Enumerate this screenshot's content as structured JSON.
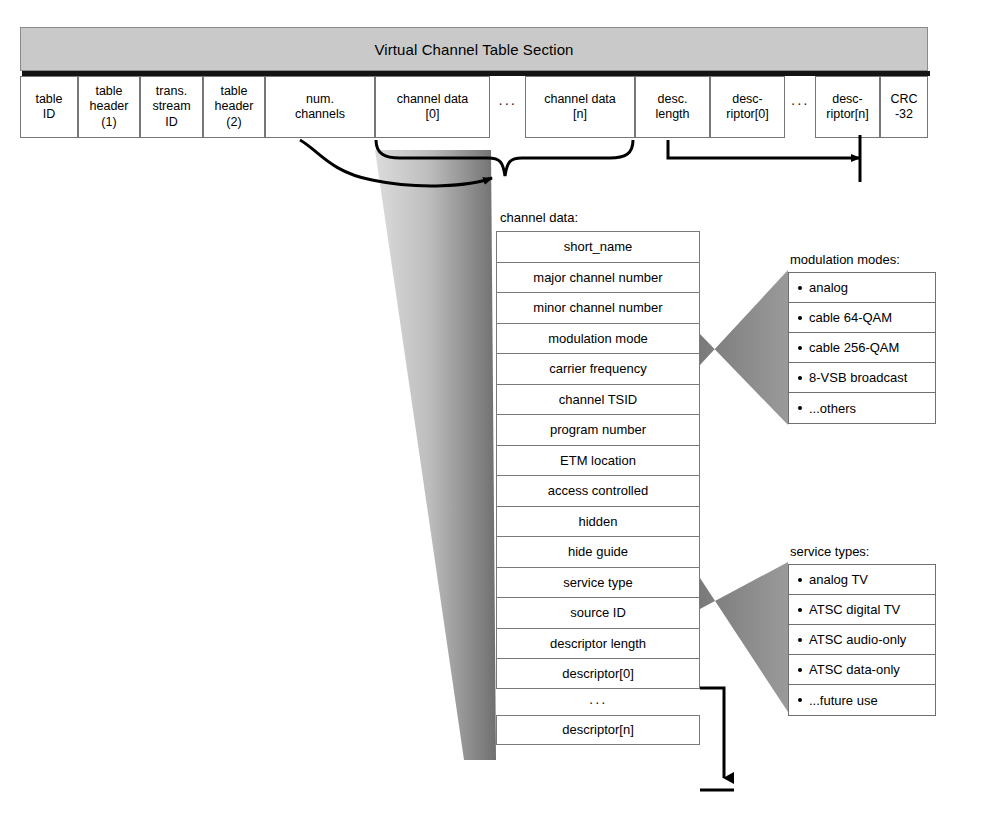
{
  "section": {
    "title": "Virtual Channel Table Section",
    "fields": [
      {
        "label": "table\nID",
        "name": "field-table-id",
        "x": 0,
        "w": 58
      },
      {
        "label": "table\nheader\n(1)",
        "name": "field-table-header-1",
        "x": 58,
        "w": 62
      },
      {
        "label": "trans.\nstream\nID",
        "name": "field-trans-stream-id",
        "x": 120,
        "w": 63
      },
      {
        "label": "table\nheader\n(2)",
        "name": "field-table-header-2",
        "x": 183,
        "w": 62
      },
      {
        "label": "num.\nchannels",
        "name": "field-num-channels",
        "x": 245,
        "w": 110
      },
      {
        "label": "channel data\n[0]",
        "name": "field-channel-data-0",
        "x": 355,
        "w": 115
      },
      {
        "label": "···",
        "name": "field-ellipsis-1",
        "x": 470,
        "w": 35,
        "ellipsis": true
      },
      {
        "label": "channel data\n[n]",
        "name": "field-channel-data-n",
        "x": 505,
        "w": 110
      },
      {
        "label": "desc.\nlength",
        "name": "field-desc-length",
        "x": 615,
        "w": 75
      },
      {
        "label": "desc-\nriptor[0]",
        "name": "field-descriptor-0",
        "x": 690,
        "w": 75
      },
      {
        "label": "···",
        "name": "field-ellipsis-2",
        "x": 765,
        "w": 30,
        "ellipsis": true
      },
      {
        "label": "desc-\nriptor[n]",
        "name": "field-descriptor-n",
        "x": 795,
        "w": 65
      },
      {
        "label": "CRC\n-32",
        "name": "field-crc-32",
        "x": 860,
        "w": 48
      }
    ]
  },
  "channel_data": {
    "caption": "channel data:",
    "rows": [
      "short_name",
      "major channel number",
      "minor channel number",
      "modulation mode",
      "carrier frequency",
      "channel TSID",
      "program number",
      "ETM location",
      "access controlled",
      "hidden",
      "hide guide",
      "service type",
      "source ID",
      "descriptor length",
      "descriptor[0]"
    ],
    "ellipsis": "···",
    "last_row": "descriptor[n]"
  },
  "modulation_modes": {
    "caption": "modulation modes:",
    "items": [
      "analog",
      "cable 64-QAM",
      "cable 256-QAM",
      "8-VSB broadcast",
      "...others"
    ]
  },
  "service_types": {
    "caption": "service types:",
    "items": [
      "analog TV",
      "ATSC digital TV",
      "ATSC audio-only",
      "ATSC data-only",
      "...future use"
    ]
  },
  "colors": {
    "section_bar_fill": "#c9c9c9",
    "section_bar_shadow": "#141414",
    "cone_light": "#cfcfcf",
    "cone_dark": "#7c7c7c",
    "cell_border": "#777777",
    "page_background": "#ffffff"
  }
}
